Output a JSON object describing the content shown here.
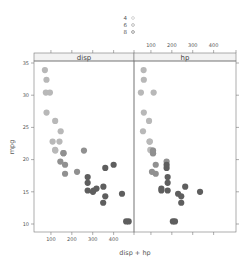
{
  "chart_data": {
    "type": "scatter",
    "title": "",
    "xlabel": "disp + hp",
    "ylabel": "mpg",
    "xlim": [
      19,
      500
    ],
    "ylim": [
      9,
      36
    ],
    "x_ticks": [
      100,
      200,
      300,
      400
    ],
    "y_ticks": [
      10,
      15,
      20,
      25,
      30,
      35
    ],
    "grid": false,
    "legend": {
      "position": "top",
      "title": "",
      "entries": [
        {
          "label": "4",
          "color": "#b8b8b8"
        },
        {
          "label": "6",
          "color": "#909090"
        },
        {
          "label": "8",
          "color": "#5e5e5e"
        }
      ]
    },
    "panels": [
      {
        "strip": "disp",
        "x_variable": "disp",
        "series": [
          {
            "name": "4",
            "color": "#b8b8b8",
            "points": [
              [
                108,
                22.8
              ],
              [
                146.7,
                24.4
              ],
              [
                140.8,
                22.8
              ],
              [
                78.7,
                32.4
              ],
              [
                75.7,
                30.4
              ],
              [
                71.1,
                33.9
              ],
              [
                120.1,
                21.5
              ],
              [
                79,
                27.3
              ],
              [
                120.3,
                26
              ],
              [
                95.1,
                30.4
              ],
              [
                121,
                21.4
              ]
            ]
          },
          {
            "name": "6",
            "color": "#909090",
            "points": [
              [
                160,
                21
              ],
              [
                160,
                21
              ],
              [
                258,
                21.4
              ],
              [
                225,
                18.1
              ],
              [
                167.6,
                19.2
              ],
              [
                167.6,
                17.8
              ],
              [
                145,
                19.7
              ]
            ]
          },
          {
            "name": "8",
            "color": "#5e5e5e",
            "points": [
              [
                360,
                18.7
              ],
              [
                360,
                14.3
              ],
              [
                275.8,
                16.4
              ],
              [
                275.8,
                17.3
              ],
              [
                275.8,
                15.2
              ],
              [
                472,
                10.4
              ],
              [
                460,
                10.4
              ],
              [
                440,
                14.7
              ],
              [
                318,
                15.5
              ],
              [
                304,
                15.2
              ],
              [
                350,
                13.3
              ],
              [
                400,
                19.2
              ],
              [
                351,
                15.8
              ],
              [
                301,
                15
              ]
            ]
          }
        ]
      },
      {
        "strip": "hp",
        "x_variable": "hp",
        "series": [
          {
            "name": "4",
            "color": "#b8b8b8",
            "points": [
              [
                93,
                22.8
              ],
              [
                62,
                24.4
              ],
              [
                95,
                22.8
              ],
              [
                66,
                32.4
              ],
              [
                52,
                30.4
              ],
              [
                65,
                33.9
              ],
              [
                97,
                21.5
              ],
              [
                66,
                27.3
              ],
              [
                91,
                26
              ],
              [
                113,
                30.4
              ],
              [
                109,
                21.4
              ]
            ]
          },
          {
            "name": "6",
            "color": "#909090",
            "points": [
              [
                110,
                21
              ],
              [
                110,
                21
              ],
              [
                110,
                21.4
              ],
              [
                105,
                18.1
              ],
              [
                123,
                19.2
              ],
              [
                123,
                17.8
              ],
              [
                175,
                19.7
              ]
            ]
          },
          {
            "name": "8",
            "color": "#5e5e5e",
            "points": [
              [
                175,
                18.7
              ],
              [
                245,
                14.3
              ],
              [
                180,
                16.4
              ],
              [
                180,
                17.3
              ],
              [
                180,
                15.2
              ],
              [
                205,
                10.4
              ],
              [
                215,
                10.4
              ],
              [
                230,
                14.7
              ],
              [
                150,
                15.5
              ],
              [
                150,
                15.2
              ],
              [
                245,
                13.3
              ],
              [
                175,
                19.2
              ],
              [
                264,
                15.8
              ],
              [
                335,
                15
              ]
            ]
          }
        ]
      }
    ]
  },
  "legend": {
    "items": [
      {
        "label": "4"
      },
      {
        "label": "6"
      },
      {
        "label": "8"
      }
    ]
  },
  "panels": {
    "left_strip": "disp",
    "right_strip": "hp"
  },
  "axes": {
    "xlabel": "disp + hp",
    "ylabel": "mpg",
    "x_tick_labels": [
      "100",
      "200",
      "300",
      "400"
    ],
    "y_tick_labels": [
      "10",
      "15",
      "20",
      "25",
      "30",
      "35"
    ]
  }
}
